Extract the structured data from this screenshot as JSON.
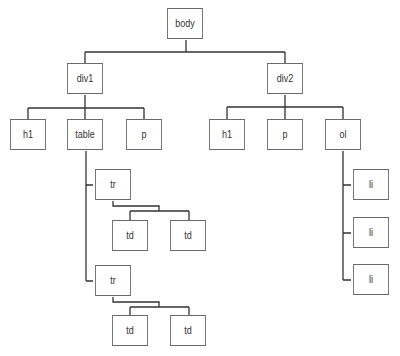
{
  "diagram": {
    "type": "dom-tree",
    "line_color": "#333333",
    "box_border_color": "#6a6a6a",
    "nodes": {
      "body": "body",
      "div1": "div1",
      "div2": "div2",
      "div1_h1": "h1",
      "div1_table": "table",
      "div1_p": "p",
      "div2_h1": "h1",
      "div2_p": "p",
      "div2_ol": "ol",
      "tr1": "tr",
      "tr1_td1": "td",
      "tr1_td2": "td",
      "tr2": "tr",
      "tr2_td1": "td",
      "tr2_td2": "td",
      "li1": "li",
      "li2": "li",
      "li3": "li"
    },
    "edges": [
      [
        "body",
        "div1"
      ],
      [
        "body",
        "div2"
      ],
      [
        "div1",
        "div1_h1"
      ],
      [
        "div1",
        "div1_table"
      ],
      [
        "div1",
        "div1_p"
      ],
      [
        "div2",
        "div2_h1"
      ],
      [
        "div2",
        "div2_p"
      ],
      [
        "div2",
        "div2_ol"
      ],
      [
        "div1_table",
        "tr1"
      ],
      [
        "div1_table",
        "tr2"
      ],
      [
        "tr1",
        "tr1_td1"
      ],
      [
        "tr1",
        "tr1_td2"
      ],
      [
        "tr2",
        "tr2_td1"
      ],
      [
        "tr2",
        "tr2_td2"
      ],
      [
        "div2_ol",
        "li1"
      ],
      [
        "div2_ol",
        "li2"
      ],
      [
        "div2_ol",
        "li3"
      ]
    ]
  }
}
